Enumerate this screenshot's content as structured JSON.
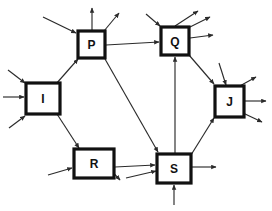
{
  "diagram": {
    "type": "directed-graph",
    "title": "",
    "canvas": {
      "width": 272,
      "height": 211
    },
    "style": {
      "background_color": "#ffffff",
      "node_fill": "#ffffff",
      "node_stroke": "#111111",
      "node_stroke_width": 3.2,
      "edge_color": "#2b2b2b",
      "edge_width": 1.15,
      "label_color": "#111111"
    },
    "nodes": [
      {
        "id": "P",
        "label": "P",
        "x": 78,
        "y": 31,
        "w": 27,
        "h": 27,
        "font_size": 12
      },
      {
        "id": "Q",
        "label": "Q",
        "x": 161,
        "y": 27,
        "w": 28,
        "h": 28,
        "font_size": 12
      },
      {
        "id": "I",
        "label": "I",
        "x": 26,
        "y": 83,
        "w": 34,
        "h": 31,
        "font_size": 12
      },
      {
        "id": "J",
        "label": "J",
        "x": 215,
        "y": 86,
        "w": 29,
        "h": 31,
        "font_size": 12
      },
      {
        "id": "R",
        "label": "R",
        "x": 74,
        "y": 149,
        "w": 40,
        "h": 29,
        "font_size": 12
      },
      {
        "id": "S",
        "label": "S",
        "x": 157,
        "y": 154,
        "w": 34,
        "h": 29,
        "font_size": 12
      }
    ],
    "edges": [
      {
        "from": "I",
        "to": "P",
        "x1": 56,
        "y1": 84,
        "x2": 78,
        "y2": 59
      },
      {
        "from": "P",
        "to": "Q",
        "x1": 106,
        "y1": 45,
        "x2": 159,
        "y2": 42
      },
      {
        "from": "P",
        "to": "S",
        "x1": 105,
        "y1": 59,
        "x2": 158,
        "y2": 152
      },
      {
        "from": "I",
        "to": "R",
        "x1": 57,
        "y1": 114,
        "x2": 79,
        "y2": 148
      },
      {
        "from": "R",
        "to": "S",
        "x1": 115,
        "y1": 167,
        "x2": 155,
        "y2": 165
      },
      {
        "from": "S",
        "to": "Q",
        "x1": 175,
        "y1": 153,
        "x2": 175,
        "y2": 57
      },
      {
        "from": "Q",
        "to": "J",
        "x1": 189,
        "y1": 55,
        "x2": 214,
        "y2": 84
      },
      {
        "from": "S",
        "to": "J",
        "x1": 191,
        "y1": 155,
        "x2": 214,
        "y2": 118
      }
    ],
    "external_arrows": [
      {
        "node": "P",
        "direction": "in",
        "x1": 43,
        "y1": 17,
        "x2": 76,
        "y2": 33
      },
      {
        "node": "P",
        "direction": "out",
        "x1": 92,
        "y1": 30,
        "x2": 92,
        "y2": 8
      },
      {
        "node": "P",
        "direction": "out",
        "x1": 104,
        "y1": 31,
        "x2": 119,
        "y2": 13
      },
      {
        "node": "Q",
        "direction": "in",
        "x1": 146,
        "y1": 14,
        "x2": 160,
        "y2": 26
      },
      {
        "node": "Q",
        "direction": "out",
        "x1": 175,
        "y1": 26,
        "x2": 198,
        "y2": 11
      },
      {
        "node": "Q",
        "direction": "out",
        "x1": 186,
        "y1": 29,
        "x2": 210,
        "y2": 17
      },
      {
        "node": "Q",
        "direction": "out",
        "x1": 190,
        "y1": 38,
        "x2": 213,
        "y2": 35
      },
      {
        "node": "I",
        "direction": "in",
        "x1": 8,
        "y1": 70,
        "x2": 25,
        "y2": 83
      },
      {
        "node": "I",
        "direction": "in",
        "x1": 3,
        "y1": 97,
        "x2": 24,
        "y2": 97
      },
      {
        "node": "I",
        "direction": "in",
        "x1": 9,
        "y1": 128,
        "x2": 25,
        "y2": 116
      },
      {
        "node": "J",
        "direction": "in",
        "x1": 219,
        "y1": 63,
        "x2": 226,
        "y2": 85
      },
      {
        "node": "J",
        "direction": "out",
        "x1": 238,
        "y1": 87,
        "x2": 256,
        "y2": 77
      },
      {
        "node": "J",
        "direction": "out",
        "x1": 245,
        "y1": 101,
        "x2": 266,
        "y2": 101
      },
      {
        "node": "J",
        "direction": "out",
        "x1": 243,
        "y1": 113,
        "x2": 262,
        "y2": 122
      },
      {
        "node": "R",
        "direction": "in",
        "x1": 48,
        "y1": 175,
        "x2": 72,
        "y2": 168
      },
      {
        "node": "R",
        "direction": "out",
        "x1": 105,
        "y1": 164,
        "x2": 120,
        "y2": 180
      },
      {
        "node": "S",
        "direction": "in",
        "x1": 126,
        "y1": 178,
        "x2": 156,
        "y2": 171
      },
      {
        "node": "S",
        "direction": "in",
        "x1": 174,
        "y1": 205,
        "x2": 174,
        "y2": 185
      },
      {
        "node": "S",
        "direction": "out",
        "x1": 192,
        "y1": 167,
        "x2": 216,
        "y2": 167
      }
    ]
  }
}
